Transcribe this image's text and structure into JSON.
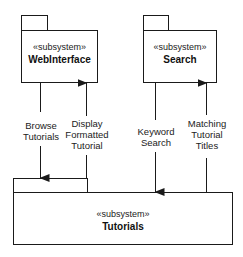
{
  "diagram": {
    "type": "UML package/subsystem diagram",
    "line_color": "#1a1a1a",
    "subsystems": [
      {
        "id": "webinterface",
        "stereotype": "«subsystem»",
        "name": "WebInterface"
      },
      {
        "id": "search",
        "stereotype": "«subsystem»",
        "name": "Search"
      },
      {
        "id": "tutorials",
        "stereotype": "«subsystem»",
        "name": "Tutorials"
      }
    ],
    "flows": [
      {
        "from": "webinterface",
        "to": "tutorials",
        "label_lines": [
          "Browse",
          "Tutorials"
        ]
      },
      {
        "from": "tutorials",
        "to": "webinterface",
        "label_lines": [
          "Display",
          "Formatted",
          "Tutorial"
        ]
      },
      {
        "from": "search",
        "to": "tutorials",
        "label_lines": [
          "Keyword",
          "Search"
        ]
      },
      {
        "from": "tutorials",
        "to": "search",
        "label_lines": [
          "Matching",
          "Tutorial",
          "Titles"
        ]
      }
    ]
  }
}
